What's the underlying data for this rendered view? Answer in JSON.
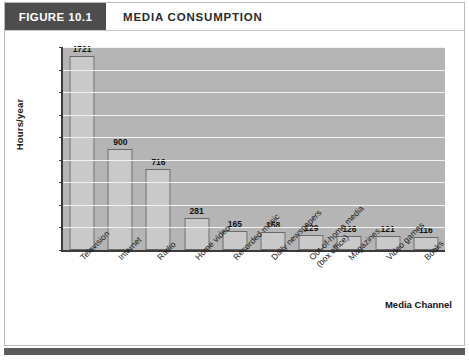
{
  "figure": {
    "tag": "FIGURE 10.1",
    "title": "MEDIA CONSUMPTION"
  },
  "chart_data": {
    "type": "bar",
    "title": "MEDIA CONSUMPTION",
    "xlabel": "Media Channel",
    "ylabel": "Hours/year",
    "ylim": [
      0,
      1800
    ],
    "ytick_step": 200,
    "yticks": [
      0,
      200,
      400,
      600,
      800,
      1000,
      1200,
      1400,
      1600,
      1800
    ],
    "grid": "horizontal",
    "legend": "none",
    "categories": [
      "Television",
      "Internet",
      "Radio",
      "Home video",
      "Recorded music",
      "Daily newspapers",
      "Out-of-home media (box office)",
      "Magazines",
      "Video games",
      "Books"
    ],
    "category_lines": [
      [
        "Television"
      ],
      [
        "Internet"
      ],
      [
        "Radio"
      ],
      [
        "Home video"
      ],
      [
        "Recorded music"
      ],
      [
        "Daily newspapers"
      ],
      [
        "Out-of-home media",
        "(box office)"
      ],
      [
        "Magazines"
      ],
      [
        "Video games"
      ],
      [
        "Books"
      ]
    ],
    "values": [
      1721,
      900,
      716,
      281,
      165,
      158,
      129,
      126,
      121,
      116
    ],
    "value_labels": [
      "1721",
      "900",
      "716",
      "281",
      "165",
      "158",
      "129",
      "126",
      "121",
      "116"
    ],
    "colors": {
      "bar_fill": "#c9c9c9",
      "bar_edge": "#6a6a6a",
      "plot_background": "#b5b5b5",
      "gridline": "#f2f2f2",
      "axis": "#3a3a3a",
      "tag_background": "#4d4d4d",
      "footer_rule": "#5b5b5b"
    }
  }
}
